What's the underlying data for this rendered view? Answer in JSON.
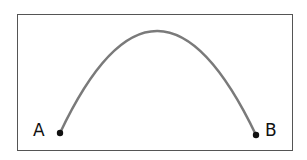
{
  "diagram": {
    "type": "trajectory-arc",
    "frame": {
      "border_color": "#555555",
      "background": "#ffffff"
    },
    "curve": {
      "color": "#7a7a7a",
      "width": 2.5,
      "start": {
        "x": 60,
        "y": 133
      },
      "apex": {
        "x": 157,
        "y": 31
      },
      "end": {
        "x": 256,
        "y": 135
      }
    },
    "points": [
      {
        "id": "A",
        "label": "A",
        "x": 60,
        "y": 133,
        "color": "#111111"
      },
      {
        "id": "B",
        "label": "B",
        "x": 256,
        "y": 135,
        "color": "#111111"
      }
    ]
  }
}
